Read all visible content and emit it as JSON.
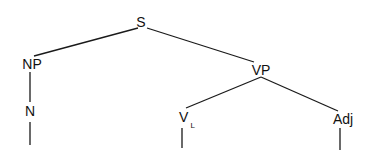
{
  "diagram": {
    "type": "syntax-tree",
    "root": "S",
    "nodes": [
      {
        "id": "S",
        "label": "S",
        "parent": null
      },
      {
        "id": "NP",
        "label": "NP",
        "parent": "S"
      },
      {
        "id": "VP",
        "label": "VP",
        "parent": "S"
      },
      {
        "id": "N",
        "label": "N",
        "parent": "NP"
      },
      {
        "id": "V",
        "label": "V",
        "subscript": "L",
        "parent": "VP"
      },
      {
        "id": "Adj",
        "label": "Adj",
        "parent": "VP"
      }
    ],
    "leaves": [
      {
        "parent": "N",
        "label": ""
      },
      {
        "parent": "V",
        "label": ""
      },
      {
        "parent": "Adj",
        "label": ""
      }
    ]
  }
}
